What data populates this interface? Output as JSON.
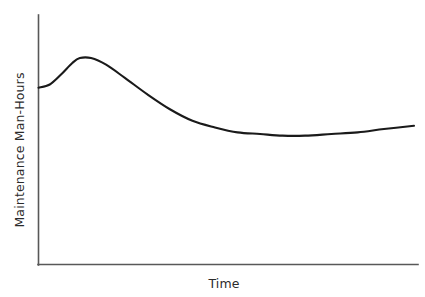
{
  "chart_data": {
    "type": "line",
    "title": "",
    "subtitle": "",
    "xlabel": "Time",
    "ylabel": "Maintenance Man-Hours",
    "grid": false,
    "legend": false,
    "legend_position": "none",
    "axes": {
      "x_ticks": [],
      "y_ticks": [],
      "x_tick_labels": [],
      "y_tick_labels": [],
      "xlim": [
        0,
        1
      ],
      "ylim": [
        0,
        1
      ],
      "x_axis_arrow": false,
      "y_axis_arrow": false
    },
    "annotations": [],
    "series": [
      {
        "name": "Maintenance Man-Hours",
        "color": "#1a1a1a",
        "line_width": 2.1,
        "style": "solid",
        "description": "Infant-mortality bathtub curve: initial burn-in rise to an early peak, steep decline to a long flat steady-state trough, then a slow wear-out rise at the end.",
        "x": [
          0.0,
          0.03,
          0.06,
          0.09,
          0.11,
          0.14,
          0.18,
          0.23,
          0.29,
          0.35,
          0.41,
          0.47,
          0.53,
          0.59,
          0.65,
          0.71,
          0.78,
          0.85,
          0.92,
          1.0
        ],
        "y": [
          0.68,
          0.7,
          0.76,
          0.83,
          0.86,
          0.86,
          0.82,
          0.74,
          0.64,
          0.55,
          0.48,
          0.44,
          0.41,
          0.4,
          0.39,
          0.39,
          0.4,
          0.41,
          0.43,
          0.45
        ],
        "key_points": {
          "start": {
            "x": 0.0,
            "y": 0.68,
            "label": "initial level"
          },
          "peak": {
            "x": 0.125,
            "y": 0.86,
            "label": "early-life peak"
          },
          "inflection": {
            "x": 0.3,
            "y": 0.62,
            "label": "steep decline"
          },
          "minimum": {
            "x": 0.655,
            "y": 0.39,
            "label": "steady-state minimum"
          },
          "end": {
            "x": 1.0,
            "y": 0.45,
            "label": "wear-out rise"
          }
        }
      }
    ],
    "colors": {
      "background": "#ffffff",
      "curve": "#1a1a1a",
      "axis": "#585858",
      "label_text": "#2b2b2b"
    }
  },
  "labels": {
    "y_axis": "Maintenance Man-Hours",
    "x_axis": "Time"
  }
}
